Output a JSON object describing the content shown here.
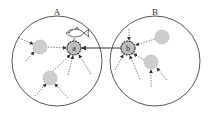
{
  "diagram": {
    "regions": [
      {
        "id": "A",
        "label": "A",
        "cx": 57,
        "cy": 61,
        "r": 45
      },
      {
        "id": "B",
        "label": "B",
        "cx": 155,
        "cy": 61,
        "r": 45
      }
    ],
    "hubs": [
      {
        "id": "a",
        "label": "a",
        "cx": 74,
        "cy": 48,
        "r": 7,
        "region": "A"
      },
      {
        "id": "b",
        "label": "b",
        "cx": 128,
        "cy": 48,
        "r": 7,
        "region": "B"
      }
    ],
    "peers": [
      {
        "cx": 40,
        "cy": 47,
        "r": 7,
        "region": "A"
      },
      {
        "cx": 50,
        "cy": 78,
        "r": 7,
        "region": "A"
      },
      {
        "cx": 162,
        "cy": 37,
        "r": 7,
        "region": "B"
      },
      {
        "cx": 151,
        "cy": 62,
        "r": 7,
        "region": "B"
      }
    ],
    "icon": "fish-icon",
    "colors": {
      "stroke": "#555555",
      "node_fill": "#cccccc",
      "hub_stroke": "#333333",
      "background": "#ffffff"
    }
  }
}
